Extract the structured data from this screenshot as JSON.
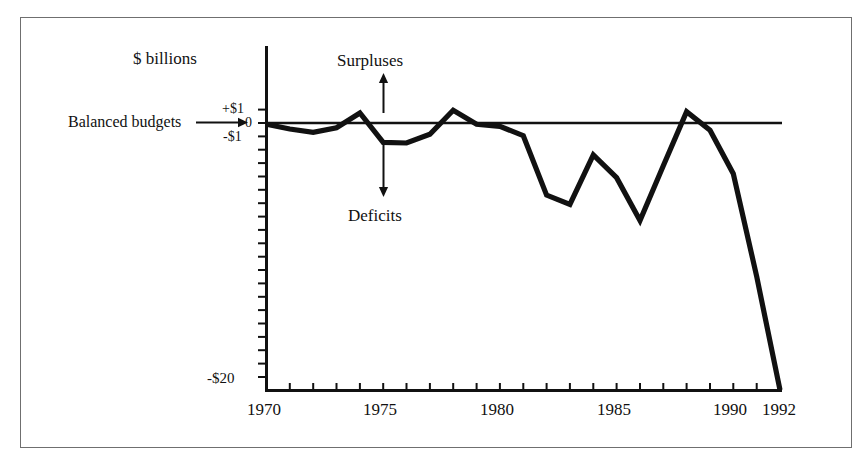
{
  "figure": {
    "background_color": "#ffffff",
    "frame_color": "#6f6f6f",
    "ink_color": "#111111"
  },
  "annotations": {
    "yaxis_title": "$ billions",
    "balanced_budgets": "Balanced budgets",
    "balanced_budgets_arrow": "right-arrow",
    "surpluses": "Surpluses",
    "surpluses_arrow": "up-arrow",
    "deficits": "Deficits",
    "deficits_arrow": "down-arrow"
  },
  "chart_data": {
    "type": "line",
    "title": "",
    "xlabel": "",
    "ylabel": "$ billions",
    "xlim": [
      1970,
      1992
    ],
    "ylim": [
      -20,
      1.8
    ],
    "grid": false,
    "legend": null,
    "zero_reference_line": 0,
    "zero_reference_label": "Balanced budgets",
    "y_tick_labels": [
      "+$1",
      "0",
      "-$1",
      "-$20"
    ],
    "y_tick_values": [
      1,
      0,
      -1,
      -20
    ],
    "y_minor_tick_step": 1,
    "x_tick_labels": [
      "1970",
      "1975",
      "1980",
      "1985",
      "1990",
      "1992"
    ],
    "x_tick_values": [
      1970,
      1975,
      1980,
      1985,
      1990,
      1992
    ],
    "x_minor_tick_step": 1,
    "x": [
      1970,
      1971,
      1972,
      1973,
      1974,
      1975,
      1976,
      1977,
      1978,
      1979,
      1980,
      1981,
      1982,
      1983,
      1984,
      1985,
      1986,
      1987,
      1988,
      1989,
      1990,
      1991,
      1992
    ],
    "values": [
      -0.1,
      -0.45,
      -0.7,
      -0.35,
      0.75,
      -1.45,
      -1.5,
      -0.85,
      0.95,
      -0.1,
      -0.25,
      -0.95,
      -5.4,
      -6.1,
      -2.4,
      -4.1,
      -7.3,
      -3.2,
      0.85,
      -0.55,
      -3.8,
      -11.5,
      -20.0
    ],
    "series_label": "Budget balance",
    "annotations": [
      {
        "text": "Surpluses",
        "direction": "up",
        "at_x": 1975
      },
      {
        "text": "Deficits",
        "direction": "down",
        "at_x": 1975
      },
      {
        "text": "Balanced budgets",
        "direction": "right",
        "at_y": 0
      }
    ]
  }
}
